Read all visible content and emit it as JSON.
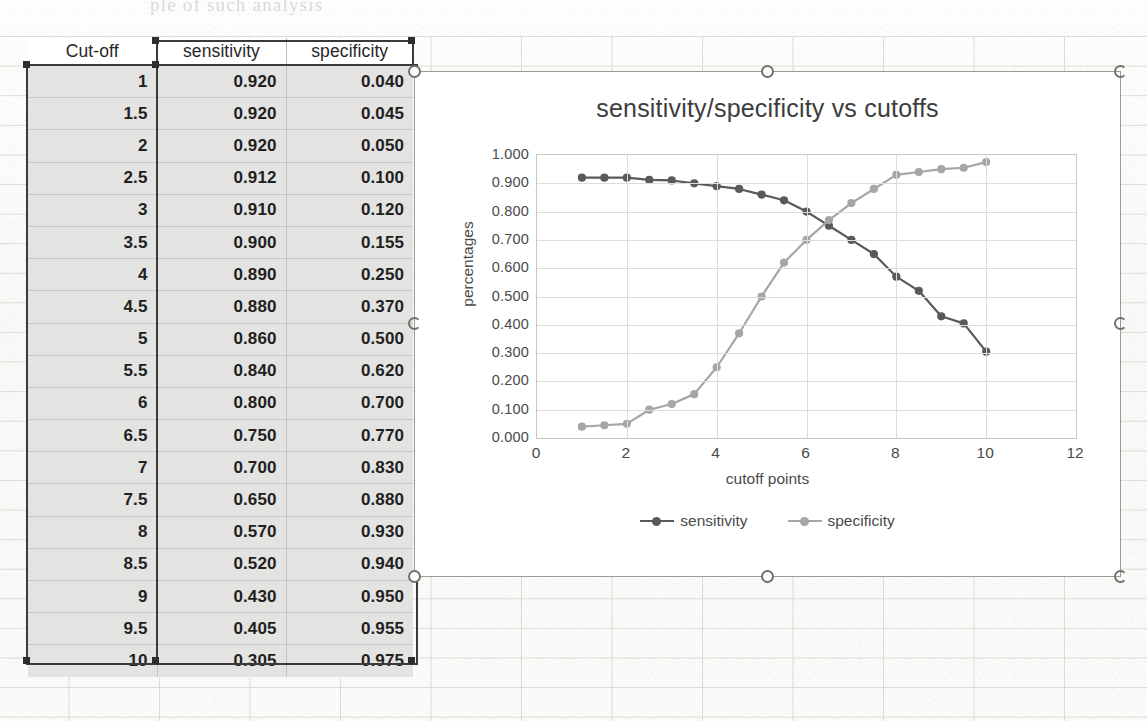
{
  "sheet": {
    "ghost_text_top": "ple of such analysis",
    "table": {
      "headers": [
        "Cut-off",
        "sensitivity",
        "specificity"
      ],
      "rows": [
        [
          "1",
          "0.920",
          "0.040"
        ],
        [
          "1.5",
          "0.920",
          "0.045"
        ],
        [
          "2",
          "0.920",
          "0.050"
        ],
        [
          "2.5",
          "0.912",
          "0.100"
        ],
        [
          "3",
          "0.910",
          "0.120"
        ],
        [
          "3.5",
          "0.900",
          "0.155"
        ],
        [
          "4",
          "0.890",
          "0.250"
        ],
        [
          "4.5",
          "0.880",
          "0.370"
        ],
        [
          "5",
          "0.860",
          "0.500"
        ],
        [
          "5.5",
          "0.840",
          "0.620"
        ],
        [
          "6",
          "0.800",
          "0.700"
        ],
        [
          "6.5",
          "0.750",
          "0.770"
        ],
        [
          "7",
          "0.700",
          "0.830"
        ],
        [
          "7.5",
          "0.650",
          "0.880"
        ],
        [
          "8",
          "0.570",
          "0.930"
        ],
        [
          "8.5",
          "0.520",
          "0.940"
        ],
        [
          "9",
          "0.430",
          "0.950"
        ],
        [
          "9.5",
          "0.405",
          "0.955"
        ],
        [
          "10",
          "0.305",
          "0.975"
        ]
      ]
    }
  },
  "chart_data": {
    "type": "line",
    "title": "sensitivity/specificity vs cutoffs",
    "xlabel": "cutoff points",
    "ylabel": "percentages",
    "x": [
      1,
      1.5,
      2,
      2.5,
      3,
      3.5,
      4,
      4.5,
      5,
      5.5,
      6,
      6.5,
      7,
      7.5,
      8,
      8.5,
      9,
      9.5,
      10
    ],
    "series": [
      {
        "name": "sensitivity",
        "color": "#595959",
        "values": [
          0.92,
          0.92,
          0.92,
          0.912,
          0.91,
          0.9,
          0.89,
          0.88,
          0.86,
          0.84,
          0.8,
          0.75,
          0.7,
          0.65,
          0.57,
          0.52,
          0.43,
          0.405,
          0.305
        ]
      },
      {
        "name": "specificity",
        "color": "#a6a6a6",
        "values": [
          0.04,
          0.045,
          0.05,
          0.1,
          0.12,
          0.155,
          0.25,
          0.37,
          0.5,
          0.62,
          0.7,
          0.77,
          0.83,
          0.88,
          0.93,
          0.94,
          0.95,
          0.955,
          0.975
        ]
      }
    ],
    "xlim": [
      0,
      12
    ],
    "ylim": [
      0,
      1.0
    ],
    "xticks": [
      "0",
      "2",
      "4",
      "6",
      "8",
      "10",
      "12"
    ],
    "xtick_values": [
      0,
      2,
      4,
      6,
      8,
      10,
      12
    ],
    "yticks": [
      "0.000",
      "0.100",
      "0.200",
      "0.300",
      "0.400",
      "0.500",
      "0.600",
      "0.700",
      "0.800",
      "0.900",
      "1.000"
    ],
    "ytick_values": [
      0,
      0.1,
      0.2,
      0.3,
      0.4,
      0.5,
      0.6,
      0.7,
      0.8,
      0.9,
      1.0
    ],
    "grid": "horizontal-and-vertical",
    "legend_position": "bottom",
    "marker": "circle"
  }
}
